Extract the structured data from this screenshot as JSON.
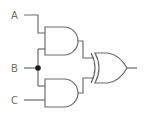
{
  "diagram": {
    "type": "logic-circuit",
    "inputs": [
      {
        "id": "A",
        "label": "A"
      },
      {
        "id": "B",
        "label": "B"
      },
      {
        "id": "C",
        "label": "C"
      }
    ],
    "gates": [
      {
        "id": "and1",
        "type": "AND",
        "inputs": [
          "A",
          "B"
        ]
      },
      {
        "id": "and2",
        "type": "AND",
        "inputs": [
          "B",
          "C"
        ]
      },
      {
        "id": "xor1",
        "type": "XOR",
        "inputs": [
          "and1",
          "and2"
        ]
      }
    ],
    "output": {
      "from": "xor1",
      "label": ""
    },
    "colors": {
      "stroke": "#6b6b6b",
      "background": "#ffffff",
      "junction": "#1a1a1a"
    }
  }
}
